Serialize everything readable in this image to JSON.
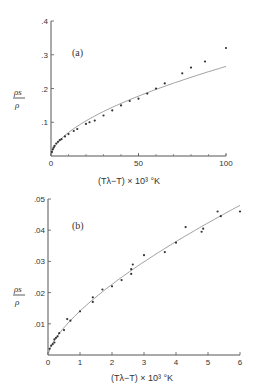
{
  "chart_data": [
    {
      "type": "scatter",
      "panel": "(a)",
      "title": "",
      "xlabel": "(Tλ−T) × 10³  °K",
      "ylabel": "ρs/ρ",
      "xlim": [
        0,
        100
      ],
      "ylim": [
        0,
        0.4
      ],
      "xticks": [
        0,
        50,
        100
      ],
      "xtick_labels": [
        "0",
        "50",
        "100"
      ],
      "yticks": [
        0.1,
        0.2,
        0.3,
        0.4
      ],
      "ytick_labels": [
        ".1",
        ".2",
        ".3",
        ".4"
      ],
      "grid": false,
      "fit_line": true,
      "points": [
        {
          "x": 0.5,
          "y": 0.012
        },
        {
          "x": 1,
          "y": 0.02
        },
        {
          "x": 1.5,
          "y": 0.025
        },
        {
          "x": 2,
          "y": 0.03
        },
        {
          "x": 3,
          "y": 0.037
        },
        {
          "x": 4,
          "y": 0.042
        },
        {
          "x": 5,
          "y": 0.047
        },
        {
          "x": 6,
          "y": 0.05
        },
        {
          "x": 8,
          "y": 0.058
        },
        {
          "x": 10,
          "y": 0.065
        },
        {
          "x": 13,
          "y": 0.074
        },
        {
          "x": 15,
          "y": 0.08
        },
        {
          "x": 20,
          "y": 0.095
        },
        {
          "x": 22,
          "y": 0.1
        },
        {
          "x": 25,
          "y": 0.105
        },
        {
          "x": 30,
          "y": 0.12
        },
        {
          "x": 35,
          "y": 0.135
        },
        {
          "x": 40,
          "y": 0.15
        },
        {
          "x": 45,
          "y": 0.163
        },
        {
          "x": 50,
          "y": 0.17
        },
        {
          "x": 55,
          "y": 0.185
        },
        {
          "x": 60,
          "y": 0.2
        },
        {
          "x": 65,
          "y": 0.215
        },
        {
          "x": 75,
          "y": 0.245
        },
        {
          "x": 80,
          "y": 0.262
        },
        {
          "x": 88,
          "y": 0.28
        },
        {
          "x": 100,
          "y": 0.32
        }
      ]
    },
    {
      "type": "scatter",
      "panel": "(b)",
      "title": "",
      "xlabel": "(Tλ−T) × 10³  °K",
      "ylabel": "ρs/ρ",
      "xlim": [
        0,
        6
      ],
      "ylim": [
        0,
        0.05
      ],
      "xticks": [
        0,
        1,
        2,
        3,
        4,
        5,
        6
      ],
      "xtick_labels": [
        "0",
        "1",
        "2",
        "3",
        "4",
        "5",
        "6"
      ],
      "yticks": [
        0.01,
        0.02,
        0.03,
        0.04,
        0.05
      ],
      "ytick_labels": [
        ".01",
        ".02",
        ".03",
        ".04",
        ".05"
      ],
      "grid": false,
      "fit_line": true,
      "points": [
        {
          "x": 0.05,
          "y": 0.002
        },
        {
          "x": 0.1,
          "y": 0.003
        },
        {
          "x": 0.15,
          "y": 0.0035
        },
        {
          "x": 0.2,
          "y": 0.004
        },
        {
          "x": 0.2,
          "y": 0.005
        },
        {
          "x": 0.25,
          "y": 0.0055
        },
        {
          "x": 0.3,
          "y": 0.006
        },
        {
          "x": 0.35,
          "y": 0.007
        },
        {
          "x": 0.5,
          "y": 0.008
        },
        {
          "x": 0.6,
          "y": 0.0115
        },
        {
          "x": 0.7,
          "y": 0.011
        },
        {
          "x": 1.0,
          "y": 0.014
        },
        {
          "x": 1.4,
          "y": 0.017
        },
        {
          "x": 1.4,
          "y": 0.0185
        },
        {
          "x": 1.7,
          "y": 0.021
        },
        {
          "x": 2.0,
          "y": 0.022
        },
        {
          "x": 2.3,
          "y": 0.024
        },
        {
          "x": 2.6,
          "y": 0.026
        },
        {
          "x": 2.6,
          "y": 0.0275
        },
        {
          "x": 2.65,
          "y": 0.029
        },
        {
          "x": 3.0,
          "y": 0.032
        },
        {
          "x": 3.65,
          "y": 0.033
        },
        {
          "x": 4.0,
          "y": 0.036
        },
        {
          "x": 4.3,
          "y": 0.041
        },
        {
          "x": 4.8,
          "y": 0.0395
        },
        {
          "x": 4.85,
          "y": 0.0405
        },
        {
          "x": 5.3,
          "y": 0.046
        },
        {
          "x": 5.4,
          "y": 0.0445
        },
        {
          "x": 6.0,
          "y": 0.046
        }
      ]
    }
  ],
  "labels": {
    "panel_a": "(a)",
    "panel_b": "(b)",
    "ylabel_num": "ρs",
    "ylabel_den": "ρ",
    "xlabel": "(Tλ−T) × 10³  °K"
  }
}
